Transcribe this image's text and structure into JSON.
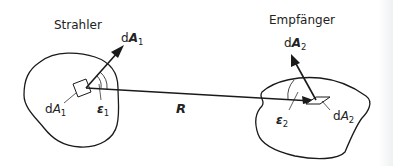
{
  "diagram": {
    "emitter": {
      "title": "Strahler",
      "vector_label": "d",
      "vector_symbol": "A",
      "vector_sub": "1",
      "area_label": "d",
      "area_symbol": "A",
      "area_sub": "1",
      "angle_symbol": "ε",
      "angle_sub": "1"
    },
    "receiver": {
      "title": "Empfänger",
      "vector_label": "d",
      "vector_symbol": "A",
      "vector_sub": "2",
      "area_label": "d",
      "area_symbol": "A",
      "area_sub": "2",
      "angle_symbol": "ε",
      "angle_sub": "2"
    },
    "distance_label": "R",
    "colors": {
      "line": "#1a1a1a",
      "background": "#ffffff"
    }
  }
}
